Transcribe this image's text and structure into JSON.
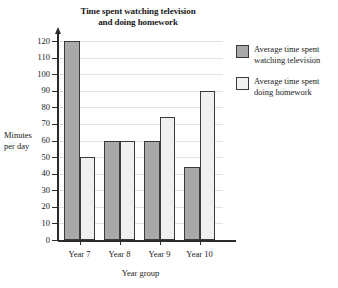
{
  "chart_data": {
    "type": "bar",
    "title": "Time spent watching television and doing homework",
    "title_line1": "Time spent watching television",
    "title_line2": "and doing homework",
    "categories": [
      "Year 7",
      "Year 8",
      "Year 9",
      "Year 10"
    ],
    "series": [
      {
        "name": "Average time spent watching television",
        "name_line1": "Average time spent",
        "name_line2": "watching television",
        "color": "#a9a9a9",
        "values": [
          120,
          60,
          60,
          44
        ]
      },
      {
        "name": "Average time spent doing homework",
        "name_line1": "Average time spent",
        "name_line2": "doing homework",
        "color": "#f0f0f0",
        "values": [
          50,
          60,
          74,
          90
        ]
      }
    ],
    "xlabel": "Year group",
    "ylabel": "Minutes per day",
    "ylabel_line1": "Minutes",
    "ylabel_line2": "per day",
    "ylim": [
      0,
      120
    ],
    "ytick_step": 10,
    "yticks": [
      0,
      10,
      20,
      30,
      40,
      50,
      60,
      70,
      80,
      90,
      100,
      110,
      120
    ],
    "ytick_labels": [
      "0",
      "10",
      "20",
      "30",
      "40",
      "50",
      "60",
      "70",
      "80",
      "90",
      "100",
      "110",
      "120"
    ],
    "grid": true,
    "legend_position": "right",
    "axis_color": "#2b2b2b",
    "grid_color": "#e2e2e2",
    "background": "#ffffff"
  }
}
